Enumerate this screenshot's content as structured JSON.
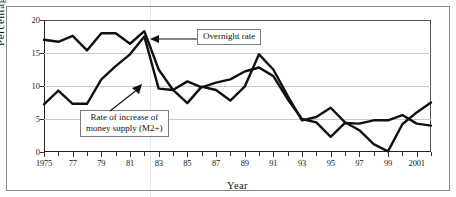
{
  "chart_data": {
    "type": "line",
    "title": "",
    "xlabel": "Year",
    "ylabel": "Percentage",
    "ylim": [
      0,
      20
    ],
    "xlim": [
      1975,
      2002
    ],
    "yticks": [
      0,
      5,
      10,
      15,
      20
    ],
    "xticks": [
      1975,
      1976,
      1977,
      1978,
      1979,
      1980,
      1981,
      1982,
      1983,
      1984,
      1985,
      1986,
      1987,
      1988,
      1989,
      1990,
      1991,
      1992,
      1993,
      1994,
      1995,
      1996,
      1997,
      1998,
      1999,
      2000,
      2001,
      2002
    ],
    "xtick_labels": [
      "1975",
      "",
      "77",
      "",
      "79",
      "",
      "81",
      "",
      "83",
      "",
      "85",
      "",
      "87",
      "",
      "89",
      "",
      "91",
      "",
      "93",
      "",
      "95",
      "",
      "97",
      "",
      "99",
      "",
      "2001",
      ""
    ],
    "grid": "horizontal",
    "legend": "annotations",
    "x": [
      1975,
      1976,
      1977,
      1978,
      1979,
      1980,
      1981,
      1982,
      1983,
      1984,
      1985,
      1986,
      1987,
      1988,
      1989,
      1990,
      1991,
      1992,
      1993,
      1994,
      1995,
      1996,
      1997,
      1998,
      1999,
      2000,
      2001,
      2002
    ],
    "series": [
      {
        "name": "Overnight rate",
        "values": [
          17.0,
          16.7,
          17.6,
          15.4,
          18.0,
          18.0,
          16.4,
          18.3,
          12.5,
          9.4,
          10.7,
          9.8,
          10.5,
          11.0,
          12.2,
          12.8,
          11.5,
          8.0,
          5.0,
          4.5,
          2.3,
          4.4,
          4.3,
          4.8,
          4.8,
          5.6,
          4.3,
          4.0
        ]
      },
      {
        "name": "Rate of increase of money supply (M2+)",
        "values": [
          7.2,
          9.3,
          7.3,
          7.3,
          11.0,
          13.0,
          14.8,
          17.5,
          9.6,
          9.4,
          7.4,
          9.9,
          9.4,
          7.8,
          9.9,
          14.8,
          12.5,
          8.5,
          4.8,
          5.3,
          6.7,
          4.5,
          3.3,
          1.2,
          0.1,
          4.2,
          6.0,
          7.5
        ]
      }
    ],
    "annotations": [
      {
        "id": "overnight",
        "text": "Overnight rate",
        "arrow": "left"
      },
      {
        "id": "money",
        "line1": "Rate of increase of",
        "line2": "money supply (M2+)",
        "arrow": "up-right"
      }
    ],
    "colors": {
      "line": "#111111",
      "grid": "#c9c9c9",
      "axis": "#222222",
      "background": "#ffffff",
      "frame": "#8a8a8a"
    }
  }
}
